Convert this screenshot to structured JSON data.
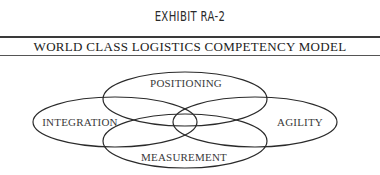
{
  "exhibit": {
    "label": "EXHIBIT RA-2",
    "title": "WORLD CLASS LOGISTICS COMPETENCY MODEL"
  },
  "diagram": {
    "type": "overlapping-ellipses",
    "stroke_color": "#2a2a2a",
    "nodes": [
      {
        "id": "positioning",
        "label": "POSITIONING",
        "position": "top"
      },
      {
        "id": "integration",
        "label": "INTEGRATION",
        "position": "left"
      },
      {
        "id": "agility",
        "label": "AGILITY",
        "position": "right"
      },
      {
        "id": "measurement",
        "label": "MEASUREMENT",
        "position": "bottom"
      }
    ]
  }
}
